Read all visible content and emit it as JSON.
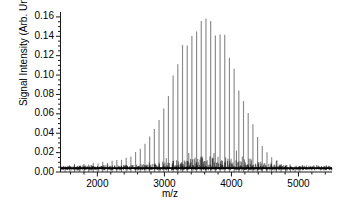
{
  "chart_data": {
    "type": "line",
    "title": "",
    "subtitle": "",
    "xlabel": "m/z",
    "ylabel": "Signal Intensity (Arb. Units)",
    "xlim": [
      1450,
      5500
    ],
    "ylim": [
      0.0,
      0.163
    ],
    "grid": false,
    "legend": null,
    "xticks": [
      2000,
      3000,
      4000,
      5000
    ],
    "xticklabels": [
      "2000",
      "3000",
      "4000",
      "5000"
    ],
    "xminor_step": 200,
    "yticks": [
      0.0,
      0.02,
      0.04,
      0.06,
      0.08,
      0.1,
      0.12,
      0.14,
      0.16
    ],
    "yticklabels": [
      "0.00",
      "0.02",
      "0.04",
      "0.06",
      "0.08",
      "0.10",
      "0.12",
      "0.14",
      "0.16"
    ],
    "yminor_step": 0.005,
    "axis_color": "#1a1a1a",
    "series": [
      {
        "name": "polymer comb envelope",
        "type": "stem",
        "color": "#8a8a8a",
        "peak_spacing": 70,
        "first_peak_x": 1520,
        "envelope_center": 3750,
        "envelope_sigma": 440,
        "envelope_peak": 0.157,
        "baseline": 0.004,
        "x": [
          1520,
          1590,
          1660,
          1730,
          1800,
          1870,
          1940,
          2010,
          2080,
          2150,
          2220,
          2290,
          2360,
          2430,
          2500,
          2570,
          2640,
          2710,
          2780,
          2850,
          2920,
          2990,
          3060,
          3130,
          3200,
          3270,
          3340,
          3410,
          3480,
          3550,
          3620,
          3690,
          3760,
          3830,
          3900,
          3970,
          4040,
          4110,
          4180,
          4250,
          4320,
          4390,
          4460,
          4530,
          4600,
          4670,
          4740,
          4810,
          4880
        ],
        "values": [
          0.006,
          0.006,
          0.007,
          0.007,
          0.008,
          0.008,
          0.009,
          0.009,
          0.01,
          0.01,
          0.011,
          0.012,
          0.013,
          0.015,
          0.017,
          0.02,
          0.024,
          0.029,
          0.036,
          0.045,
          0.056,
          0.068,
          0.082,
          0.096,
          0.11,
          0.124,
          0.136,
          0.146,
          0.153,
          0.157,
          0.156,
          0.152,
          0.151,
          0.144,
          0.133,
          0.12,
          0.105,
          0.09,
          0.075,
          0.061,
          0.048,
          0.037,
          0.028,
          0.02,
          0.015,
          0.011,
          0.008,
          0.007,
          0.006
        ]
      },
      {
        "name": "baseline noise",
        "type": "noise",
        "color": "#000000",
        "baseline_level": 0.004,
        "noise_amplitude_low": 0.003,
        "noise_amplitude_peak": 0.013,
        "noise_center": 3750
      }
    ]
  },
  "axes": {
    "ylabel_text": "Signal Intensity (Arb. Units)",
    "xlabel_text": "m/z"
  }
}
